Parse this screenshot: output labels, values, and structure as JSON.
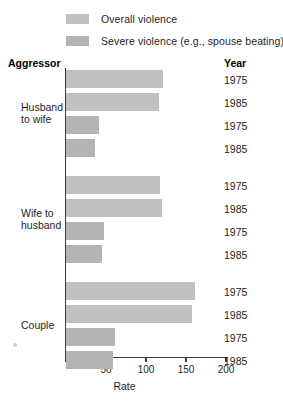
{
  "legend": {
    "items": [
      {
        "label": "Overall violence",
        "color": "#c0c0c0",
        "key": "overall"
      },
      {
        "label": "Severe violence (e.g., spouse beating)",
        "color": "#b4b4b4",
        "key": "severe"
      }
    ]
  },
  "headers": {
    "aggressor": "Aggressor",
    "year": "Year"
  },
  "chart_data": {
    "type": "bar",
    "orientation": "horizontal",
    "title": "",
    "xlabel": "Rate",
    "ylabel": "Aggressor",
    "xlim": [
      0,
      215
    ],
    "xticks": [
      0,
      50,
      100,
      150,
      200
    ],
    "xticklabels": [
      "",
      "50",
      "100",
      "150",
      "200"
    ],
    "grid": false,
    "legend_position": "top",
    "groups": [
      {
        "label": "Husband\nto wife",
        "bars": [
          {
            "year": "1975",
            "series": "Overall violence",
            "value": 121
          },
          {
            "year": "1985",
            "series": "Overall violence",
            "value": 116
          },
          {
            "year": "1975",
            "series": "Severe violence (e.g., spouse beating)",
            "value": 41
          },
          {
            "year": "1985",
            "series": "Severe violence (e.g., spouse beating)",
            "value": 36
          }
        ]
      },
      {
        "label": "Wife to\nhusband",
        "bars": [
          {
            "year": "1975",
            "series": "Overall violence",
            "value": 117
          },
          {
            "year": "1985",
            "series": "Overall violence",
            "value": 120
          },
          {
            "year": "1975",
            "series": "Severe violence (e.g., spouse beating)",
            "value": 47
          },
          {
            "year": "1985",
            "series": "Severe violence (e.g., spouse beating)",
            "value": 45
          }
        ]
      },
      {
        "label": "Couple",
        "bars": [
          {
            "year": "1975",
            "series": "Overall violence",
            "value": 161
          },
          {
            "year": "1985",
            "series": "Overall violence",
            "value": 158
          },
          {
            "year": "1975",
            "series": "Severe violence (e.g., spouse beating)",
            "value": 61
          },
          {
            "year": "1985",
            "series": "Severe violence (e.g., spouse beating)",
            "value": 59
          }
        ]
      }
    ]
  },
  "geometry": {
    "x_origin_px": 66,
    "px_per_unit": 0.8,
    "bar_height_px": 18,
    "bar_gap_px": 5,
    "group_gap_px": 14,
    "first_bar_top_px": 70,
    "year_label_offset_px": 4
  }
}
